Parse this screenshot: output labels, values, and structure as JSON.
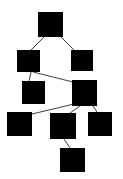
{
  "diagram": {
    "background_color": "#ffffff",
    "node_color": "#000000",
    "edge_color": "#3c3c3c",
    "edge_width": 1,
    "canvas": {
      "width": 123,
      "height": 179
    },
    "nodes": [
      {
        "id": "n1",
        "label": "",
        "shape": "square",
        "x": 38,
        "y": 12,
        "w": 25,
        "h": 25,
        "cx": 50.5,
        "cy": 24.5
      },
      {
        "id": "n2",
        "label": "",
        "shape": "square",
        "x": 17,
        "y": 50,
        "w": 23,
        "h": 22,
        "cx": 28.5,
        "cy": 61.0
      },
      {
        "id": "n3",
        "label": "",
        "shape": "square",
        "x": 71,
        "y": 50,
        "w": 22,
        "h": 21,
        "cx": 82.0,
        "cy": 60.5
      },
      {
        "id": "n4",
        "label": "",
        "shape": "square",
        "x": 22,
        "y": 81,
        "w": 23,
        "h": 23,
        "cx": 33.5,
        "cy": 92.5
      },
      {
        "id": "n5",
        "label": "",
        "shape": "square",
        "x": 72,
        "y": 80,
        "w": 25,
        "h": 26,
        "cx": 84.5,
        "cy": 93.0
      },
      {
        "id": "n6",
        "label": "",
        "shape": "square",
        "x": 7,
        "y": 112,
        "w": 25,
        "h": 24,
        "cx": 19.5,
        "cy": 124.0
      },
      {
        "id": "n7",
        "label": "",
        "shape": "square",
        "x": 50,
        "y": 113,
        "w": 26,
        "h": 26,
        "cx": 63.0,
        "cy": 126.0
      },
      {
        "id": "n8",
        "label": "",
        "shape": "square",
        "x": 88,
        "y": 112,
        "w": 24,
        "h": 24,
        "cx": 100.0,
        "cy": 124.0
      },
      {
        "id": "n9",
        "label": "",
        "shape": "square",
        "x": 60,
        "y": 148,
        "w": 25,
        "h": 24,
        "cx": 72.5,
        "cy": 160.0
      }
    ],
    "edges": [
      {
        "id": "e1",
        "source": "n1",
        "target": "n2",
        "x1": 44,
        "y1": 37,
        "x2": 31,
        "y2": 50
      },
      {
        "id": "e2",
        "source": "n1",
        "target": "n3",
        "x1": 61,
        "y1": 37,
        "x2": 74,
        "y2": 50
      },
      {
        "id": "e3",
        "source": "n2",
        "target": "n4",
        "x1": 31,
        "y1": 72,
        "x2": 29,
        "y2": 81
      },
      {
        "id": "e4",
        "source": "n2",
        "target": "n5",
        "x1": 33,
        "y1": 72,
        "x2": 73,
        "y2": 82
      },
      {
        "id": "e5",
        "source": "n5",
        "target": "n6",
        "x1": 74,
        "y1": 104,
        "x2": 32,
        "y2": 114
      },
      {
        "id": "e6",
        "source": "n5",
        "target": "n7",
        "x1": 80,
        "y1": 106,
        "x2": 70,
        "y2": 113
      },
      {
        "id": "e7",
        "source": "n5",
        "target": "n8",
        "x1": 93,
        "y1": 106,
        "x2": 97,
        "y2": 112
      },
      {
        "id": "e8",
        "source": "n7",
        "target": "n9",
        "x1": 64,
        "y1": 139,
        "x2": 70,
        "y2": 148
      }
    ]
  }
}
